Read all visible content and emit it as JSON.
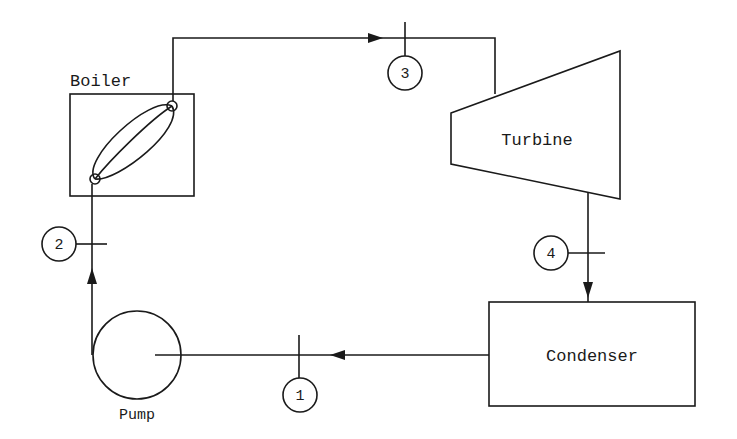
{
  "diagram": {
    "components": {
      "boiler": {
        "label": "Boiler"
      },
      "turbine": {
        "label": "Turbine"
      },
      "condenser": {
        "label": "Condenser"
      },
      "pump": {
        "label": "Pump"
      }
    },
    "state_points": [
      {
        "id": "1",
        "label": "1",
        "location": "pump inlet (condenser to pump)"
      },
      {
        "id": "2",
        "label": "2",
        "location": "pump outlet (pump to boiler)"
      },
      {
        "id": "3",
        "label": "3",
        "location": "turbine inlet (boiler to turbine)"
      },
      {
        "id": "4",
        "label": "4",
        "location": "turbine outlet (turbine to condenser)"
      }
    ],
    "colors": {
      "line": "#1a1a1a",
      "background": "#ffffff"
    }
  }
}
